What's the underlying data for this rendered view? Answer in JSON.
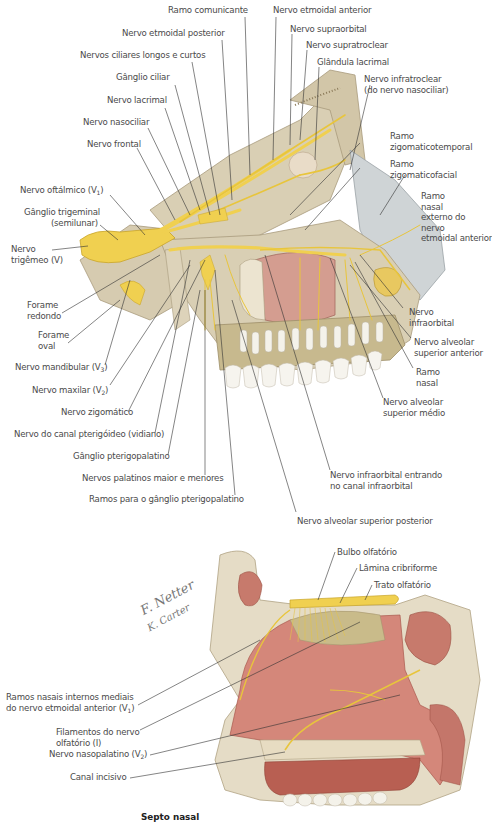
{
  "figure": {
    "top_panel": {
      "name": "lateral view of orbit and maxilla nerves",
      "labels": {
        "ramo_comunicante": "Ramo comunicante",
        "nervo_etmoidal_anterior": "Nervo etmoidal anterior",
        "nervo_etmoidal_posterior": "Nervo etmoidal posterior",
        "nervo_supraorbital": "Nervo supraorbital",
        "nervos_ciliares": "Nervos ciliares longos e curtos",
        "nervo_supratroclear": "Nervo supratroclear",
        "ganglio_ciliar": "Gânglio ciliar",
        "glandula_lacrimal": "Glândula lacrimal",
        "nervo_infratroclear_1": "Nervo infratroclear",
        "nervo_infratroclear_2": "(do nervo nasociliar)",
        "nervo_lacrimal": "Nervo lacrimal",
        "nervo_nasociliar": "Nervo nasociliar",
        "nervo_frontal": "Nervo frontal",
        "ramo_zigomaticotemporal_1": "Ramo",
        "ramo_zigomaticotemporal_2": "zigomaticotemporal",
        "ramo_zigomaticofacial_1": "Ramo",
        "ramo_zigomaticofacial_2": "zigomaticofacial",
        "ramo_nasal_externo_1": "Ramo",
        "ramo_nasal_externo_2": "nasal",
        "ramo_nasal_externo_3": "externo do",
        "ramo_nasal_externo_4": "nervo",
        "ramo_nasal_externo_5": "etmoidal anterior",
        "nervo_oftalmico": "Nervo oftálmico (V",
        "nervo_oftalmico_sub": "1",
        "ganglio_trigeminal_1": "Gânglio trigeminal",
        "ganglio_trigeminal_2": "(semilunar)",
        "nervo_trigemeo_1": "Nervo",
        "nervo_trigemeo_2": "trigêmeo (V)",
        "forame_redondo_1": "Forame",
        "forame_redondo_2": "redondo",
        "forame_oval_1": "Forame",
        "forame_oval_2": "oval",
        "nervo_mandibular": "Nervo mandibular (V",
        "nervo_mandibular_sub": "3",
        "nervo_maxilar": "Nervo maxilar (V",
        "nervo_maxilar_sub": "2",
        "nervo_zigomatico": "Nervo zigomático",
        "nervo_canal_pterigoideo": "Nervo do canal pterigóideo (vidiano)",
        "ganglio_pterigopalatino": "Gânglio pterigopalatino",
        "nervos_palatinos": "Nervos palatinos maior e menores",
        "ramos_ganglio": "Ramos para o gânglio pterigopalatino",
        "nervo_infraorbital_1": "Nervo",
        "nervo_infraorbital_2": "infraorbital",
        "nervo_alveolar_anterior_1": "Nervo alveolar",
        "nervo_alveolar_anterior_2": "superior anterior",
        "ramo_nasal_1": "Ramo",
        "ramo_nasal_2": "nasal",
        "nervo_alveolar_medio_1": "Nervo alveolar",
        "nervo_alveolar_medio_2": "superior médio",
        "nervo_infraorbital_canal_1": "Nervo infraorbital entrando",
        "nervo_infraorbital_canal_2": "no canal infraorbital",
        "nervo_alveolar_posterior": "Nervo alveolar superior posterior"
      }
    },
    "bottom_panel": {
      "name": "nasal septum medial view",
      "caption": "Septo nasal",
      "signature_1": "F. Netter",
      "signature_2": "K. Carter",
      "labels": {
        "bulbo_olfatorio": "Bulbo olfatório",
        "lamina_cribriforme": "Lâmina cribriforme",
        "trato_olfatorio": "Trato olfatório",
        "ramos_nasais_1": "Ramos nasais internos mediais",
        "ramos_nasais_2": "do nervo etmoidal anterior (V",
        "ramos_nasais_sub": "1",
        "filamentos_1": "Filamentos do nervo",
        "filamentos_2": "olfatório (I)",
        "nervo_nasopalatino": "Nervo nasopalatino (V",
        "nervo_nasopalatino_sub": "2",
        "canal_incisivo": "Canal incisivo"
      }
    },
    "colors": {
      "bone": "#d9cfb4",
      "bone_dark": "#b8a98a",
      "nerve": "#f0d050",
      "nerve_dark": "#c9a52a",
      "mucosa": "#d4877a",
      "mucosa_dark": "#a9584c",
      "sinus": "#d9a79a",
      "teeth": "#f4f2ea",
      "leader": "#333333",
      "text": "#4a4a4a"
    }
  }
}
